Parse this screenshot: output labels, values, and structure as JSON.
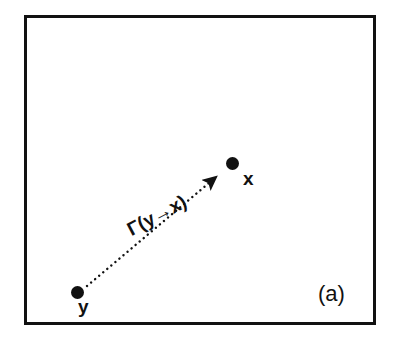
{
  "figure": {
    "panel_caption": "(a)",
    "background_color": "#ffffff",
    "stroke_color": "#111111"
  },
  "frame": {
    "border_color": "#111111",
    "border_width_px": 3,
    "fill_color": "#ffffff"
  },
  "nodes": [
    {
      "id": "y",
      "label": "y",
      "role": "source-node",
      "x": 77,
      "y": 292,
      "color": "#111111"
    },
    {
      "id": "x",
      "label": "x",
      "role": "target-node",
      "x": 232,
      "y": 163,
      "color": "#111111"
    }
  ],
  "edge": {
    "label": "Γ(y→x)",
    "from": "y",
    "to": "x",
    "style": "dotted",
    "arrowhead": "solid-triangle",
    "direction": "y-to-x",
    "color": "#111111",
    "label_rotation_deg": -28
  }
}
